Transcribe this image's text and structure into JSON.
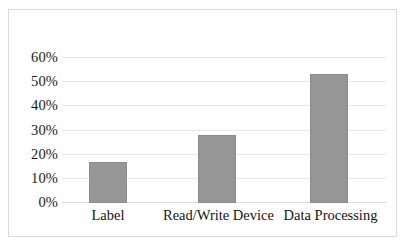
{
  "chart_data": {
    "type": "bar",
    "title": "",
    "subtitle": "",
    "xlabel": "",
    "ylabel": "",
    "categories": [
      "Label",
      "Read/Write Device",
      "Data Processing"
    ],
    "values": [
      17,
      28,
      53.5
    ],
    "value_labels": [
      "17%",
      "28%",
      "53.5%"
    ],
    "ylim": [
      0,
      60
    ],
    "ytick_values": [
      0,
      10,
      20,
      30,
      40,
      50,
      60
    ],
    "ytick_labels": [
      "0%",
      "10%",
      "20%",
      "30%",
      "40%",
      "50%",
      "60%"
    ],
    "grid": true,
    "grid_axis": "y",
    "legend": false,
    "legend_position": "none",
    "series": [
      {
        "name": "",
        "values": [
          17,
          28,
          53.5
        ]
      }
    ],
    "annotations": []
  },
  "style": {
    "bar_fill": "#969696",
    "bar_stroke": "#8c8c8c",
    "gridline_color": "#e8e8e8",
    "baseline_color": "#dcdcdc",
    "frame_color": "#d9d9d9",
    "plot_background": "#ffffff",
    "tick_text_color": "#1a1a1a"
  }
}
